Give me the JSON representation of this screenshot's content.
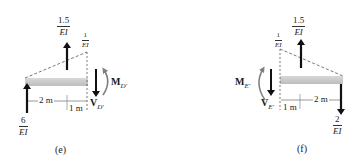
{
  "figure": {
    "panels": [
      {
        "id": "e",
        "caption": "(e)",
        "loads": {
          "left_reaction": {
            "num": "6",
            "den": "EI",
            "direction": "up"
          },
          "resultant": {
            "num": "1.5",
            "den": "EI",
            "direction": "up"
          },
          "triangle_peak": {
            "num": "1",
            "den": "EI"
          }
        },
        "dimensions": [
          "2 m",
          "1 m"
        ],
        "internal": {
          "moment": "M",
          "moment_sub": "D′",
          "shear": "V",
          "shear_sub": "D′"
        }
      },
      {
        "id": "f",
        "caption": "(f)",
        "loads": {
          "right_reaction": {
            "num": "2",
            "den": "EI",
            "direction": "down"
          },
          "resultant": {
            "num": "1.5",
            "den": "EI",
            "direction": "up"
          },
          "triangle_peak": {
            "num": "1",
            "den": "EI"
          }
        },
        "dimensions": [
          "1 m",
          "2 m"
        ],
        "internal": {
          "moment": "M",
          "moment_sub": "E′",
          "shear": "V",
          "shear_sub": "E′"
        }
      }
    ],
    "colors": {
      "beam": "#c8c8c8",
      "arrow": "#111111",
      "moment_arrow": "#808080",
      "dashed": "#555555"
    }
  }
}
